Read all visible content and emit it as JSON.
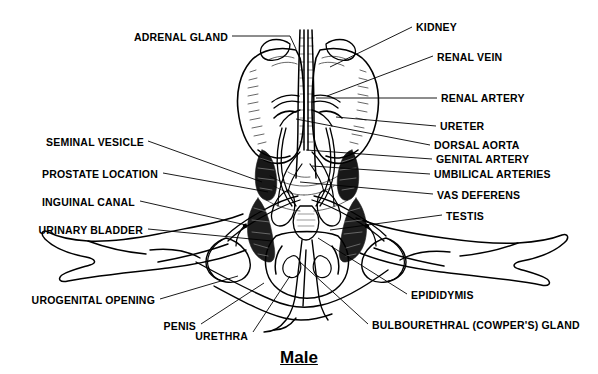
{
  "figure": {
    "title": "Male",
    "background_color": "#ffffff",
    "ink_color": "#000000",
    "labels": [
      {
        "id": "adrenal-gland",
        "text": "ADRENAL GLAND",
        "x": 228,
        "y": 38,
        "align": "right"
      },
      {
        "id": "seminal-vesicle",
        "text": "SEMINAL VESICLE",
        "x": 144,
        "y": 143,
        "align": "right"
      },
      {
        "id": "prostate-location",
        "text": "PROSTATE LOCATION",
        "x": 158,
        "y": 175,
        "align": "right"
      },
      {
        "id": "inguinal-canal",
        "text": "INGUINAL CANAL",
        "x": 135,
        "y": 203,
        "align": "right"
      },
      {
        "id": "urinary-bladder",
        "text": "URINARY BLADDER",
        "x": 143,
        "y": 231,
        "align": "right"
      },
      {
        "id": "urogenital-opening",
        "text": "UROGENITAL OPENING",
        "x": 155,
        "y": 301,
        "align": "right"
      },
      {
        "id": "penis",
        "text": "PENIS",
        "x": 196,
        "y": 327,
        "align": "right"
      },
      {
        "id": "urethra",
        "text": "URETHRA",
        "x": 248,
        "y": 337,
        "align": "right"
      },
      {
        "id": "kidney",
        "text": "KIDNEY",
        "x": 416,
        "y": 28,
        "align": "left"
      },
      {
        "id": "renal-vein",
        "text": "RENAL VEIN",
        "x": 437,
        "y": 58,
        "align": "left"
      },
      {
        "id": "renal-artery",
        "text": "RENAL ARTERY",
        "x": 441,
        "y": 99,
        "align": "left"
      },
      {
        "id": "ureter",
        "text": "URETER",
        "x": 440,
        "y": 127,
        "align": "left"
      },
      {
        "id": "dorsal-aorta",
        "text": "DORSAL AORTA",
        "x": 434,
        "y": 146,
        "align": "left"
      },
      {
        "id": "genital-artery",
        "text": "GENITAL ARTERY",
        "x": 436,
        "y": 160,
        "align": "left"
      },
      {
        "id": "umbilical-arteries",
        "text": "UMBILICAL ARTERIES",
        "x": 434,
        "y": 175,
        "align": "left"
      },
      {
        "id": "vas-deferens",
        "text": "VAS DEFERENS",
        "x": 437,
        "y": 196,
        "align": "left"
      },
      {
        "id": "testis",
        "text": "TESTIS",
        "x": 446,
        "y": 217,
        "align": "left"
      },
      {
        "id": "epididymis",
        "text": "EPIDIDYMIS",
        "x": 411,
        "y": 296,
        "align": "left"
      },
      {
        "id": "bulbourethral-gland",
        "text": "BULBOURETHRAL (COWPER'S) GLAND",
        "x": 372,
        "y": 326,
        "align": "left"
      }
    ],
    "leaders": [
      {
        "id": "adrenal-gland",
        "points": "232,36 290,36 296,49"
      },
      {
        "id": "seminal-vesicle",
        "points": "148,141 262,182"
      },
      {
        "id": "prostate-location",
        "points": "163,173 268,192"
      },
      {
        "id": "inguinal-canal",
        "points": "140,201 246,225"
      },
      {
        "id": "urinary-bladder",
        "points": "148,229 272,241"
      },
      {
        "id": "urogenital-opening",
        "points": "160,299 238,276"
      },
      {
        "id": "penis",
        "points": "201,324 264,283"
      },
      {
        "id": "urethra",
        "points": "253,332 290,276"
      },
      {
        "id": "kidney",
        "points": "412,27 330,67"
      },
      {
        "id": "renal-vein",
        "points": "433,56 327,96"
      },
      {
        "id": "renal-artery",
        "points": "437,98 316,98"
      },
      {
        "id": "ureter",
        "points": "436,126 336,117"
      },
      {
        "id": "dorsal-aorta",
        "points": "430,145 296,119"
      },
      {
        "id": "genital-artery",
        "points": "432,159 306,150"
      },
      {
        "id": "umbilical-arteries",
        "points": "430,174 312,166"
      },
      {
        "id": "vas-deferens",
        "points": "433,194 300,182"
      },
      {
        "id": "testis",
        "points": "442,215 330,230"
      },
      {
        "id": "epididymis",
        "points": "407,294 318,238"
      },
      {
        "id": "bulbourethral-gland",
        "points": "368,324 300,262"
      }
    ]
  }
}
